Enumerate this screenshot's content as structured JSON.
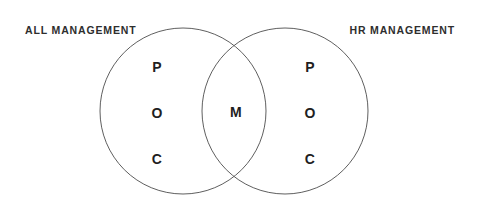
{
  "canvas": {
    "width": 479,
    "height": 209,
    "background": "#ffffff"
  },
  "diagram": {
    "type": "venn",
    "stroke_color": "#5f5f5f",
    "stroke_width": 1,
    "fill": "none",
    "text_color": "#1f1f1f",
    "label_color": "#2e2e2e"
  },
  "labels": {
    "left": "ALL MANAGEMENT",
    "right": "HR MANAGEMENT"
  },
  "sets": {
    "left": {
      "name": "ALL MANAGEMENT",
      "center_x": 183,
      "center_y": 111,
      "radius": 83,
      "items": [
        {
          "text": "P",
          "x": 157,
          "y": 67
        },
        {
          "text": "O",
          "x": 157,
          "y": 113
        },
        {
          "text": "C",
          "x": 157,
          "y": 159
        }
      ]
    },
    "right": {
      "name": "HR MANAGEMENT",
      "center_x": 285,
      "center_y": 111,
      "radius": 83,
      "items": [
        {
          "text": "P",
          "x": 310,
          "y": 67
        },
        {
          "text": "O",
          "x": 310,
          "y": 113
        },
        {
          "text": "C",
          "x": 310,
          "y": 159
        }
      ]
    },
    "intersection": {
      "items": [
        {
          "text": "M",
          "x": 236,
          "y": 112
        }
      ]
    }
  }
}
